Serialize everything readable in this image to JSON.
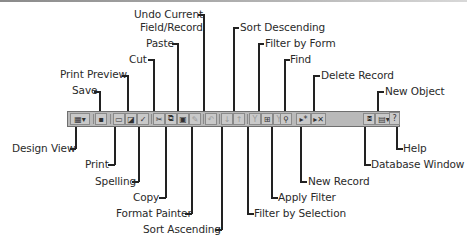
{
  "figure": {
    "top_labels": {
      "undo_current": "Undo Current",
      "field_record": "Field/Record",
      "paste": "Paste",
      "cut": "Cut",
      "print_preview": "Print Preview",
      "save": "Save",
      "sort_descending": "Sort Descending",
      "filter_by_form": "Filter by Form",
      "find": "Find",
      "delete_record": "Delete Record",
      "new_object": "New Object"
    },
    "bottom_labels": {
      "design_view": "Design View",
      "print": "Print",
      "spelling": "Spelling",
      "copy": "Copy",
      "format_painter": "Format Painter",
      "sort_ascending": "Sort Ascending",
      "filter_by_selection": "Filter by Selection",
      "apply_filter": "Apply Filter",
      "new_record": "New Record",
      "database_window": "Database Window",
      "help": "Help"
    }
  },
  "toolbar": {
    "buttons": [
      {
        "name": "design-view",
        "glyph": "▦▾"
      },
      {
        "name": "save",
        "glyph": "▪"
      },
      {
        "name": "print",
        "glyph": "▭"
      },
      {
        "name": "print-preview",
        "glyph": "◪"
      },
      {
        "name": "spelling",
        "glyph": "✓"
      },
      {
        "name": "cut",
        "glyph": "✂"
      },
      {
        "name": "copy",
        "glyph": "⧉"
      },
      {
        "name": "paste",
        "glyph": "▣"
      },
      {
        "name": "format-painter",
        "glyph": "✎"
      },
      {
        "name": "undo",
        "glyph": "↶"
      },
      {
        "name": "sort-ascending",
        "glyph": "↓"
      },
      {
        "name": "sort-descending",
        "glyph": "↑"
      },
      {
        "name": "filter-by-selection",
        "glyph": "Y"
      },
      {
        "name": "filter-by-form",
        "glyph": "⊞"
      },
      {
        "name": "apply-filter",
        "glyph": "Y"
      },
      {
        "name": "find",
        "glyph": "⚲"
      },
      {
        "name": "new-record",
        "glyph": "▸*"
      },
      {
        "name": "delete-record",
        "glyph": "▸✕"
      },
      {
        "name": "database-window",
        "glyph": "⧈"
      },
      {
        "name": "new-object",
        "glyph": "▤▾"
      },
      {
        "name": "help",
        "glyph": "?"
      }
    ]
  }
}
